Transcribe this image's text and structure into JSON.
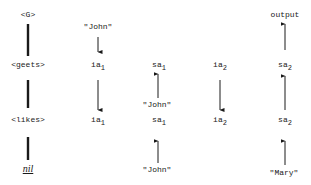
{
  "diagram": {
    "levels": [
      {
        "label": "<G>"
      },
      {
        "label": "<geets>"
      },
      {
        "label": "<likes>"
      },
      {
        "label": "nil"
      }
    ],
    "top_labels": {
      "john_input_1": "\"John\"",
      "output": "output"
    },
    "row_geets": [
      {
        "base": "ia",
        "sub": "1"
      },
      {
        "base": "sa",
        "sub": "1"
      },
      {
        "base": "ia",
        "sub": "2"
      },
      {
        "base": "sa",
        "sub": "2"
      }
    ],
    "mid_labels": {
      "john_between": "\"John\""
    },
    "row_likes": [
      {
        "base": "ia",
        "sub": "1"
      },
      {
        "base": "sa",
        "sub": "1"
      },
      {
        "base": "ia",
        "sub": "2"
      },
      {
        "base": "sa",
        "sub": "2"
      }
    ],
    "bottom_labels": {
      "john_bottom": "\"John\"",
      "mary_bottom": "\"Mary\""
    }
  }
}
